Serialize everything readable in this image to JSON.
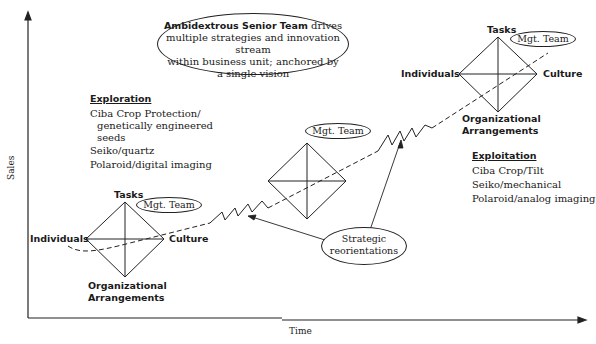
{
  "axes": {
    "y_label": "Sales",
    "x_label": "Time"
  },
  "senior_team": {
    "bold": "Ambidextrous Senior Team",
    "line1_rest": " drives",
    "line2": "multiple strategies and innovation stream",
    "line3": "within business unit; anchored by",
    "line4": "a single vision"
  },
  "exploration": {
    "heading": "Exploration",
    "items": [
      "Ciba Crop Protection/",
      "genetically engineered",
      "seeds",
      "Seiko/quartz",
      "Polaroid/digital imaging"
    ]
  },
  "exploitation": {
    "heading": "Exploitation",
    "items": [
      "Ciba Crop/Tilt",
      "Seiko/mechanical",
      "Polaroid/analog imaging"
    ]
  },
  "diamonds": [
    {
      "top": "Tasks",
      "left": "Individuals",
      "right": "Culture",
      "bottom1": "Organizational",
      "bottom2": "Arrangements",
      "mgt": "Mgt. Team"
    },
    {
      "mgt": "Mgt. Team"
    },
    {
      "top": "Tasks",
      "left": "Individuals",
      "right": "Culture",
      "bottom1": "Organizational",
      "bottom2": "Arrangements",
      "mgt": "Mgt. Team"
    }
  ],
  "strategic": {
    "line1": "Strategic",
    "line2": "reorientations"
  }
}
